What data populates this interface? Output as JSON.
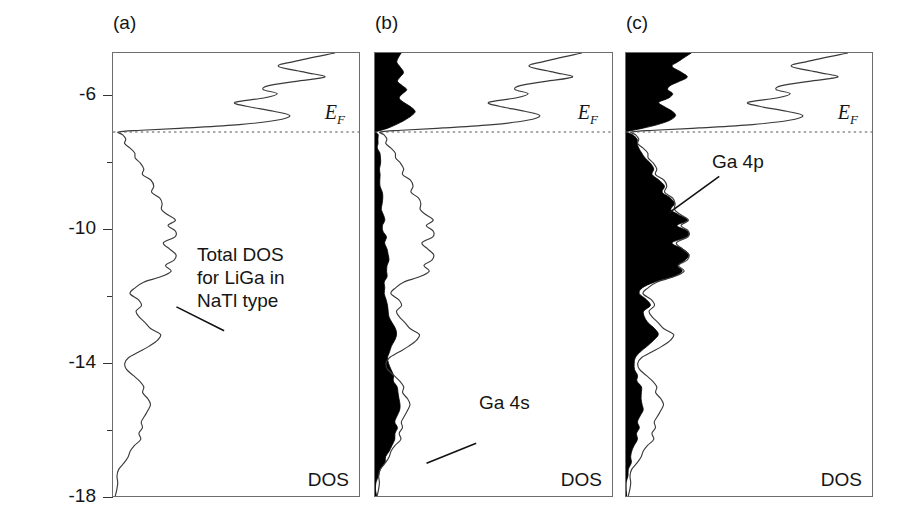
{
  "figure": {
    "axis_title": "Energy (eV)",
    "y_ticks": [
      "-6",
      "-10",
      "-14",
      "-18"
    ],
    "y_tick_values": [
      -6,
      -10,
      -14,
      -18
    ],
    "y_range": [
      -18,
      -4.7
    ],
    "fermi_level": -7.07,
    "fermi_label": "E",
    "fermi_sub": "F",
    "dos_axis_label": "DOS"
  },
  "panels": [
    {
      "tag": "(a)",
      "annotation": "Total DOS\nfor LiGa in\nNaTl type",
      "dos_label": "DOS",
      "fermi_label": "E",
      "fermi_sub": "F",
      "filled": false
    },
    {
      "tag": "(b)",
      "annotation": "Ga 4s",
      "dos_label": "DOS",
      "fermi_label": "E",
      "fermi_sub": "F",
      "filled": true
    },
    {
      "tag": "(c)",
      "annotation": "Ga 4p",
      "dos_label": "DOS",
      "fermi_label": "E",
      "fermi_sub": "F",
      "filled": true
    }
  ],
  "colors": {
    "curve": "#3a3a3a",
    "frame": "#6d6d6d",
    "fill": "#000000",
    "text": "#151515",
    "fermi_line": "#555555"
  },
  "chart_data": {
    "type": "line",
    "title": "",
    "xlabel": "DOS",
    "ylabel": "Energy (eV)",
    "ylim": [
      -18,
      -4.7
    ],
    "xlim": [
      0,
      1
    ],
    "grid": false,
    "legend": "none",
    "orientation": "horizontal-dos-vertical-energy",
    "annotations": [
      {
        "panel": "(a)",
        "text": "Total DOS for LiGa in NaTl type",
        "at_energy": -11.0
      },
      {
        "panel": "(b)",
        "text": "Ga 4s",
        "at_energy": -15.3
      },
      {
        "panel": "(c)",
        "text": "Ga 4p",
        "at_energy": -8.7
      },
      {
        "panel": "all",
        "text": "E_F",
        "at_energy": -7.07
      }
    ],
    "series": [
      {
        "name": "Total DOS (LiGa, NaTl type)",
        "panel": "(a)",
        "style": "line",
        "energies": [
          -4.7,
          -4.95,
          -5.1,
          -5.28,
          -5.42,
          -5.55,
          -5.68,
          -5.8,
          -5.92,
          -6.05,
          -6.18,
          -6.3,
          -6.45,
          -6.58,
          -6.72,
          -6.85,
          -6.95,
          -7.02,
          -7.07,
          -7.15,
          -7.28,
          -7.42,
          -7.55,
          -7.7,
          -7.85,
          -8.0,
          -8.18,
          -8.35,
          -8.52,
          -8.7,
          -8.88,
          -9.05,
          -9.22,
          -9.4,
          -9.55,
          -9.72,
          -9.88,
          -10.05,
          -10.22,
          -10.4,
          -10.58,
          -10.75,
          -10.92,
          -11.08,
          -11.25,
          -11.42,
          -11.58,
          -11.75,
          -11.92,
          -12.1,
          -12.28,
          -12.45,
          -12.62,
          -12.8,
          -12.98,
          -13.15,
          -13.32,
          -13.5,
          -13.68,
          -13.85,
          -14.02,
          -14.2,
          -14.38,
          -14.55,
          -14.72,
          -14.9,
          -15.08,
          -15.25,
          -15.42,
          -15.6,
          -15.78,
          -15.95,
          -16.12,
          -16.3,
          -16.48,
          -16.65,
          -16.82,
          -17.0,
          -17.2,
          -17.4,
          -17.6,
          -17.8,
          -18.0
        ],
        "values": [
          0.97,
          0.8,
          0.72,
          0.84,
          0.93,
          0.8,
          0.68,
          0.66,
          0.72,
          0.66,
          0.53,
          0.58,
          0.7,
          0.78,
          0.72,
          0.55,
          0.32,
          0.12,
          0.02,
          0.04,
          0.06,
          0.05,
          0.07,
          0.09,
          0.1,
          0.12,
          0.14,
          0.13,
          0.16,
          0.18,
          0.17,
          0.2,
          0.22,
          0.21,
          0.24,
          0.27,
          0.24,
          0.28,
          0.27,
          0.22,
          0.25,
          0.28,
          0.26,
          0.23,
          0.25,
          0.21,
          0.14,
          0.09,
          0.08,
          0.11,
          0.13,
          0.1,
          0.12,
          0.14,
          0.17,
          0.21,
          0.19,
          0.16,
          0.11,
          0.07,
          0.05,
          0.06,
          0.09,
          0.12,
          0.14,
          0.13,
          0.15,
          0.17,
          0.16,
          0.14,
          0.12,
          0.13,
          0.11,
          0.12,
          0.1,
          0.08,
          0.06,
          0.05,
          0.03,
          0.02,
          0.015,
          0.01,
          0.01
        ]
      },
      {
        "name": "Total DOS",
        "panel": "(b)",
        "style": "line",
        "energies": [
          -4.7,
          -4.95,
          -5.1,
          -5.28,
          -5.42,
          -5.55,
          -5.68,
          -5.8,
          -5.92,
          -6.05,
          -6.18,
          -6.3,
          -6.45,
          -6.58,
          -6.72,
          -6.85,
          -6.95,
          -7.02,
          -7.07,
          -7.15,
          -7.28,
          -7.42,
          -7.55,
          -7.7,
          -7.85,
          -8.0,
          -8.18,
          -8.35,
          -8.52,
          -8.7,
          -8.88,
          -9.05,
          -9.22,
          -9.4,
          -9.55,
          -9.72,
          -9.88,
          -10.05,
          -10.22,
          -10.4,
          -10.58,
          -10.75,
          -10.92,
          -11.08,
          -11.25,
          -11.42,
          -11.58,
          -11.75,
          -11.92,
          -12.1,
          -12.28,
          -12.45,
          -12.62,
          -12.8,
          -12.98,
          -13.15,
          -13.32,
          -13.5,
          -13.68,
          -13.85,
          -14.02,
          -14.2,
          -14.38,
          -14.55,
          -14.72,
          -14.9,
          -15.08,
          -15.25,
          -15.42,
          -15.6,
          -15.78,
          -15.95,
          -16.12,
          -16.3,
          -16.48,
          -16.65,
          -16.82,
          -17.0,
          -17.2,
          -17.4,
          -17.6,
          -17.8,
          -18.0
        ],
        "values": [
          0.97,
          0.8,
          0.72,
          0.84,
          0.93,
          0.8,
          0.68,
          0.66,
          0.72,
          0.66,
          0.53,
          0.58,
          0.7,
          0.78,
          0.72,
          0.55,
          0.32,
          0.12,
          0.02,
          0.04,
          0.06,
          0.05,
          0.07,
          0.09,
          0.1,
          0.12,
          0.14,
          0.13,
          0.16,
          0.18,
          0.17,
          0.2,
          0.22,
          0.21,
          0.24,
          0.27,
          0.24,
          0.28,
          0.27,
          0.22,
          0.25,
          0.28,
          0.26,
          0.23,
          0.25,
          0.21,
          0.14,
          0.09,
          0.08,
          0.11,
          0.13,
          0.1,
          0.12,
          0.14,
          0.17,
          0.21,
          0.19,
          0.16,
          0.11,
          0.07,
          0.05,
          0.06,
          0.09,
          0.12,
          0.14,
          0.13,
          0.15,
          0.17,
          0.16,
          0.14,
          0.12,
          0.13,
          0.11,
          0.12,
          0.1,
          0.08,
          0.06,
          0.05,
          0.03,
          0.02,
          0.015,
          0.01,
          0.01
        ]
      },
      {
        "name": "Ga 4s",
        "panel": "(b)",
        "style": "filled",
        "energies": [
          -4.7,
          -4.95,
          -5.1,
          -5.28,
          -5.42,
          -5.55,
          -5.68,
          -5.8,
          -5.92,
          -6.05,
          -6.18,
          -6.3,
          -6.45,
          -6.58,
          -6.72,
          -6.85,
          -6.95,
          -7.02,
          -7.07,
          -7.15,
          -7.28,
          -7.42,
          -7.55,
          -7.7,
          -7.85,
          -8.0,
          -8.18,
          -8.35,
          -8.52,
          -8.7,
          -8.88,
          -9.05,
          -9.22,
          -9.4,
          -9.55,
          -9.72,
          -9.88,
          -10.05,
          -10.22,
          -10.4,
          -10.58,
          -10.75,
          -10.92,
          -11.08,
          -11.25,
          -11.42,
          -11.58,
          -11.75,
          -11.92,
          -12.1,
          -12.28,
          -12.45,
          -12.62,
          -12.8,
          -12.98,
          -13.15,
          -13.32,
          -13.5,
          -13.68,
          -13.85,
          -14.02,
          -14.2,
          -14.38,
          -14.55,
          -14.72,
          -14.9,
          -15.08,
          -15.25,
          -15.42,
          -15.6,
          -15.78,
          -15.95,
          -16.12,
          -16.3,
          -16.48,
          -16.65,
          -16.82,
          -17.0,
          -17.2,
          -17.4,
          -17.6,
          -17.8,
          -18.0
        ],
        "values": [
          0.12,
          0.1,
          0.11,
          0.13,
          0.12,
          0.1,
          0.12,
          0.14,
          0.13,
          0.11,
          0.13,
          0.16,
          0.18,
          0.17,
          0.14,
          0.1,
          0.06,
          0.03,
          0.01,
          0.01,
          0.01,
          0.01,
          0.01,
          0.02,
          0.02,
          0.02,
          0.02,
          0.02,
          0.02,
          0.02,
          0.03,
          0.03,
          0.03,
          0.03,
          0.04,
          0.04,
          0.04,
          0.04,
          0.05,
          0.05,
          0.05,
          0.06,
          0.06,
          0.05,
          0.05,
          0.05,
          0.04,
          0.04,
          0.04,
          0.05,
          0.06,
          0.06,
          0.07,
          0.08,
          0.09,
          0.1,
          0.09,
          0.08,
          0.07,
          0.06,
          0.06,
          0.07,
          0.08,
          0.09,
          0.1,
          0.1,
          0.11,
          0.12,
          0.11,
          0.1,
          0.09,
          0.1,
          0.09,
          0.09,
          0.08,
          0.07,
          0.05,
          0.04,
          0.025,
          0.015,
          0.01,
          0.008,
          0.008
        ]
      },
      {
        "name": "Total DOS",
        "panel": "(c)",
        "style": "line",
        "energies": [
          -4.7,
          -4.95,
          -5.1,
          -5.28,
          -5.42,
          -5.55,
          -5.68,
          -5.8,
          -5.92,
          -6.05,
          -6.18,
          -6.3,
          -6.45,
          -6.58,
          -6.72,
          -6.85,
          -6.95,
          -7.02,
          -7.07,
          -7.15,
          -7.28,
          -7.42,
          -7.55,
          -7.7,
          -7.85,
          -8.0,
          -8.18,
          -8.35,
          -8.52,
          -8.7,
          -8.88,
          -9.05,
          -9.22,
          -9.4,
          -9.55,
          -9.72,
          -9.88,
          -10.05,
          -10.22,
          -10.4,
          -10.58,
          -10.75,
          -10.92,
          -11.08,
          -11.25,
          -11.42,
          -11.58,
          -11.75,
          -11.92,
          -12.1,
          -12.28,
          -12.45,
          -12.62,
          -12.8,
          -12.98,
          -13.15,
          -13.32,
          -13.5,
          -13.68,
          -13.85,
          -14.02,
          -14.2,
          -14.38,
          -14.55,
          -14.72,
          -14.9,
          -15.08,
          -15.25,
          -15.42,
          -15.6,
          -15.78,
          -15.95,
          -16.12,
          -16.3,
          -16.48,
          -16.65,
          -16.82,
          -17.0,
          -17.2,
          -17.4,
          -17.6,
          -17.8,
          -18.0
        ],
        "values": [
          0.97,
          0.8,
          0.72,
          0.84,
          0.93,
          0.8,
          0.68,
          0.66,
          0.72,
          0.66,
          0.53,
          0.58,
          0.7,
          0.78,
          0.72,
          0.55,
          0.32,
          0.12,
          0.02,
          0.04,
          0.06,
          0.05,
          0.07,
          0.09,
          0.1,
          0.12,
          0.14,
          0.13,
          0.16,
          0.18,
          0.17,
          0.2,
          0.22,
          0.21,
          0.24,
          0.27,
          0.24,
          0.28,
          0.27,
          0.22,
          0.25,
          0.28,
          0.26,
          0.23,
          0.25,
          0.21,
          0.14,
          0.09,
          0.08,
          0.11,
          0.13,
          0.1,
          0.12,
          0.14,
          0.17,
          0.21,
          0.19,
          0.16,
          0.11,
          0.07,
          0.05,
          0.06,
          0.09,
          0.12,
          0.14,
          0.13,
          0.15,
          0.17,
          0.16,
          0.14,
          0.12,
          0.13,
          0.11,
          0.12,
          0.1,
          0.08,
          0.06,
          0.05,
          0.03,
          0.02,
          0.015,
          0.01,
          0.01
        ]
      },
      {
        "name": "Ga 4p",
        "panel": "(c)",
        "style": "filled",
        "energies": [
          -4.7,
          -4.95,
          -5.1,
          -5.28,
          -5.42,
          -5.55,
          -5.68,
          -5.8,
          -5.92,
          -6.05,
          -6.18,
          -6.3,
          -6.45,
          -6.58,
          -6.72,
          -6.85,
          -6.95,
          -7.02,
          -7.07,
          -7.15,
          -7.28,
          -7.42,
          -7.55,
          -7.7,
          -7.85,
          -8.0,
          -8.18,
          -8.35,
          -8.52,
          -8.7,
          -8.88,
          -9.05,
          -9.22,
          -9.4,
          -9.55,
          -9.72,
          -9.88,
          -10.05,
          -10.22,
          -10.4,
          -10.58,
          -10.75,
          -10.92,
          -11.08,
          -11.25,
          -11.42,
          -11.58,
          -11.75,
          -11.92,
          -12.1,
          -12.28,
          -12.45,
          -12.62,
          -12.8,
          -12.98,
          -13.15,
          -13.32,
          -13.5,
          -13.68,
          -13.85,
          -14.02,
          -14.2,
          -14.38,
          -14.55,
          -14.72,
          -14.9,
          -15.08,
          -15.25,
          -15.42,
          -15.6,
          -15.78,
          -15.95,
          -16.12,
          -16.3,
          -16.48,
          -16.65,
          -16.82,
          -17.0,
          -17.2,
          -17.4,
          -17.6,
          -17.8,
          -18.0
        ],
        "values": [
          0.26,
          0.21,
          0.18,
          0.22,
          0.25,
          0.21,
          0.17,
          0.16,
          0.19,
          0.17,
          0.13,
          0.15,
          0.18,
          0.2,
          0.18,
          0.13,
          0.07,
          0.03,
          0.01,
          0.02,
          0.04,
          0.04,
          0.05,
          0.06,
          0.07,
          0.09,
          0.11,
          0.1,
          0.13,
          0.15,
          0.14,
          0.17,
          0.19,
          0.18,
          0.21,
          0.24,
          0.21,
          0.25,
          0.24,
          0.19,
          0.22,
          0.25,
          0.23,
          0.2,
          0.22,
          0.18,
          0.11,
          0.06,
          0.05,
          0.08,
          0.1,
          0.07,
          0.08,
          0.09,
          0.11,
          0.13,
          0.11,
          0.09,
          0.06,
          0.04,
          0.03,
          0.03,
          0.04,
          0.05,
          0.06,
          0.055,
          0.06,
          0.07,
          0.065,
          0.055,
          0.045,
          0.05,
          0.04,
          0.045,
          0.035,
          0.028,
          0.02,
          0.015,
          0.01,
          0.007,
          0.005,
          0.004,
          0.003
        ]
      }
    ]
  }
}
